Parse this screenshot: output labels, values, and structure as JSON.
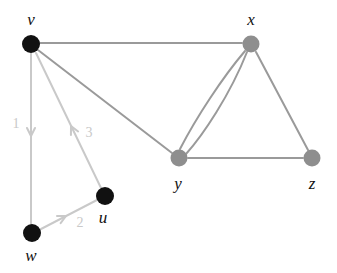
{
  "figure": {
    "width": 337,
    "height": 273,
    "background": "#ffffff"
  },
  "colors": {
    "node_black": "#111111",
    "node_gray": "#8e8e8e",
    "edge_gray": "#9a9a9a",
    "edge_light": "#c9c9c9",
    "label_text": "#111111",
    "weight_text": "#c9c9c9"
  },
  "nodes": [
    {
      "id": "v",
      "label": "v",
      "cx": 31,
      "cy": 44,
      "r": 9,
      "fill": "#111111",
      "label_x": 31,
      "label_y": 19
    },
    {
      "id": "x",
      "label": "x",
      "cx": 251,
      "cy": 44,
      "r": 8.5,
      "fill": "#8e8e8e",
      "label_x": 251,
      "label_y": 19
    },
    {
      "id": "y",
      "label": "y",
      "cx": 179,
      "cy": 158,
      "r": 8.5,
      "fill": "#8e8e8e",
      "label_x": 178,
      "label_y": 183
    },
    {
      "id": "z",
      "label": "z",
      "cx": 312,
      "cy": 158,
      "r": 8.5,
      "fill": "#8e8e8e",
      "label_x": 312,
      "label_y": 183
    },
    {
      "id": "u",
      "label": "u",
      "cx": 105,
      "cy": 196,
      "r": 9,
      "fill": "#111111",
      "label_x": 103,
      "label_y": 217
    },
    {
      "id": "w",
      "label": "w",
      "cx": 32,
      "cy": 233,
      "r": 9,
      "fill": "#111111",
      "label_x": 31,
      "label_y": 255
    }
  ],
  "undirected_edges": [
    {
      "id": "v-x",
      "from": "v",
      "to": "x",
      "path": "M 40 43 L 242 43",
      "color": "#9a9a9a",
      "width": 2.0
    },
    {
      "id": "v-y",
      "from": "v",
      "to": "y",
      "path": "M 38 50 L 172 153",
      "color": "#9a9a9a",
      "width": 2.0
    },
    {
      "id": "x-y-upper",
      "from": "x",
      "to": "y",
      "path": "M 245 51 C 222 78 196 118 180 149",
      "color": "#9a9a9a",
      "width": 2.0
    },
    {
      "id": "x-y-lower",
      "from": "x",
      "to": "y",
      "path": "M 247 52 C 230 95 203 135 186 154",
      "color": "#9a9a9a",
      "width": 2.0
    },
    {
      "id": "x-z",
      "from": "x",
      "to": "z",
      "path": "M 256 52 L 308 150",
      "color": "#9a9a9a",
      "width": 2.0
    },
    {
      "id": "y-z",
      "from": "y",
      "to": "z",
      "path": "M 188 158 L 303 158",
      "color": "#9a9a9a",
      "width": 2.0
    }
  ],
  "directed_edges": [
    {
      "id": "v-w",
      "from": "v",
      "to": "w",
      "weight": "1",
      "path": "M 31 53 L 31 224",
      "arrow_x": 31,
      "arrow_y": 136,
      "arrow_angle": 90,
      "weight_x": 16,
      "weight_y": 124,
      "color": "#c9c9c9",
      "width": 2.0
    },
    {
      "id": "w-u",
      "from": "w",
      "to": "u",
      "weight": "2",
      "path": "M 41 229 L 97 200",
      "arrow_x": 66,
      "arrow_y": 216,
      "arrow_angle": -27,
      "weight_x": 80,
      "weight_y": 223,
      "color": "#c9c9c9",
      "width": 2.0
    },
    {
      "id": "u-v",
      "from": "u",
      "to": "v",
      "weight": "3",
      "path": "M 101 188 L 36 53",
      "arrow_x": 71,
      "arrow_y": 126,
      "arrow_angle": 244,
      "weight_x": 89,
      "weight_y": 133,
      "color": "#c9c9c9",
      "width": 2.0
    }
  ]
}
